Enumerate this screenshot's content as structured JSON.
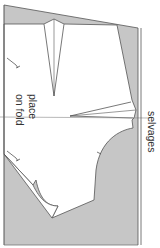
{
  "diagram": {
    "type": "sewing-pattern-layout",
    "labels": {
      "place": "place",
      "on_fold": "on fold",
      "selvages": "selvages"
    },
    "colors": {
      "fabric": "#c4c4c4",
      "pattern_piece": "#ffffff",
      "outline": "#555555",
      "text": "#333333"
    },
    "elements": {
      "fold_line": "horizontal fold line across piece",
      "selvage_edge": "double line at right edge",
      "darts": [
        "upper waist dart",
        "side dart"
      ],
      "grain_marks": [
        "upper grain mark",
        "lower grain mark"
      ]
    }
  }
}
